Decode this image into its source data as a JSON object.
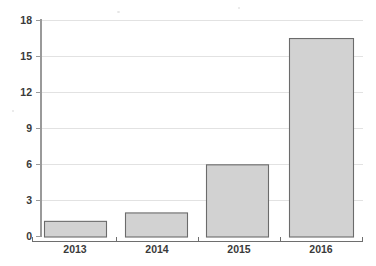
{
  "chart_data": {
    "type": "bar",
    "title": "",
    "subtitle": "",
    "xlabel": "",
    "ylabel": "",
    "categories": [
      "2013",
      "2014",
      "2015",
      "2016"
    ],
    "values": [
      1.3,
      2.0,
      6.0,
      16.5
    ],
    "ylim": [
      0,
      18
    ],
    "yticks": [
      0,
      3,
      6,
      9,
      12,
      15,
      18
    ],
    "ytick_labels": [
      "0",
      "3",
      "6",
      "9",
      "12",
      "15",
      "18"
    ],
    "grid": "horizontal",
    "legend": "none",
    "series": [
      {
        "name": "",
        "values": [
          1.3,
          2.0,
          6.0,
          16.5
        ]
      }
    ],
    "colors": {
      "bar_fill": "#d2d2d2",
      "bar_border": "#6b6b6b",
      "gridline": "#e2e2e2",
      "axis": "#9a9a9a",
      "text": "#3a3a3a",
      "background": "#ffffff"
    }
  },
  "axis": {
    "y_ticks": [
      {
        "label": "18",
        "value": 18
      },
      {
        "label": "15",
        "value": 15
      },
      {
        "label": "12",
        "value": 12
      },
      {
        "label": "9",
        "value": 9
      },
      {
        "label": "6",
        "value": 6
      },
      {
        "label": "3",
        "value": 3
      },
      {
        "label": "0",
        "value": 0
      }
    ],
    "x_categories": [
      {
        "label": "2013"
      },
      {
        "label": "2014"
      },
      {
        "label": "2015"
      },
      {
        "label": "2016"
      }
    ]
  }
}
